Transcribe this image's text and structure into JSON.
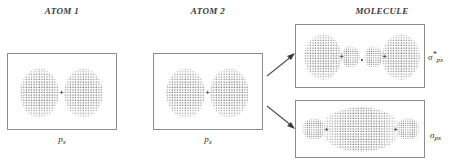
{
  "figure": {
    "title_atom1": "ATOM 1",
    "title_atom2": "ATOM 2",
    "title_molecule": "MOLECULE"
  },
  "panels": {
    "atom1": {
      "name": "atom-1-orbital-panel",
      "label_base": "p",
      "label_sub": "x",
      "lobes": 2,
      "nucleus_marker": "+"
    },
    "atom2": {
      "name": "atom-2-orbital-panel",
      "label_base": "p",
      "label_sub": "x",
      "lobes": 2,
      "nucleus_marker": "+"
    },
    "antibonding": {
      "name": "antibonding-orbital-panel",
      "label_base": "σ",
      "label_star": "*",
      "label_sub": "px",
      "nucleus_marker": "+"
    },
    "bonding": {
      "name": "bonding-orbital-panel",
      "label_base": "σ",
      "label_sub": "px",
      "nucleus_marker": "+"
    }
  },
  "arrows": {
    "to_antibonding": "arrow-up-right",
    "to_bonding": "arrow-down-right"
  },
  "colors": {
    "stipple": "#6f6f6f",
    "border": "#8c8c8c",
    "text": "#2b2b2b",
    "background": "#ffffff"
  }
}
